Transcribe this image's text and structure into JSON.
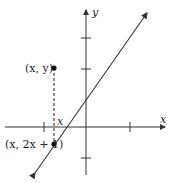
{
  "diagram": {
    "axis_x_label": "x",
    "axis_y_label": "y",
    "point_upper_label": "(x, y)",
    "point_lower_label": "(x, 2x + 1)",
    "x_marker_label": "x",
    "line_equation": "y = 2x + 1",
    "colors": {
      "ink": "#222222",
      "background": "#ffffff"
    }
  }
}
